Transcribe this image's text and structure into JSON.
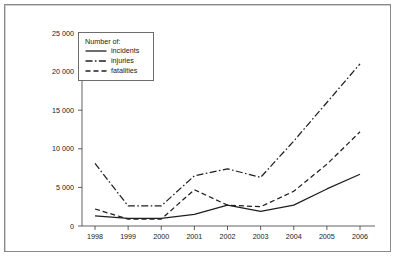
{
  "chart_data": {
    "type": "line",
    "title": "",
    "subtitle": "",
    "xlabel": "",
    "ylabel": "",
    "categories": [
      "1998",
      "1999",
      "2000",
      "2001",
      "2002",
      "2003",
      "2004",
      "2005",
      "2006"
    ],
    "x": [
      1998,
      1999,
      2000,
      2001,
      2002,
      2003,
      2004,
      2005,
      2006
    ],
    "series": [
      {
        "name": "incidents",
        "style": "solid",
        "values": [
          1300,
          1000,
          1000,
          1500,
          2700,
          1900,
          2700,
          4800,
          6700
        ]
      },
      {
        "name": "injuries",
        "style": "dash-dot",
        "values": [
          8100,
          2600,
          2600,
          6500,
          7400,
          6300,
          11000,
          16000,
          21000
        ]
      },
      {
        "name": "fatalities",
        "style": "dashed",
        "values": [
          2200,
          900,
          900,
          4700,
          2700,
          2500,
          4500,
          8000,
          12200
        ]
      }
    ],
    "ylim": [
      0,
      25000
    ],
    "yticks": [
      0,
      5000,
      10000,
      15000,
      20000,
      25000
    ],
    "ytick_labels": [
      "0",
      "5 000",
      "10 000",
      "15 000",
      "20 000",
      "25 000"
    ],
    "xtick_labels": [
      "1998",
      "1999",
      "2000",
      "2001",
      "2002",
      "2003",
      "2004",
      "2005",
      "2006"
    ],
    "grid": false,
    "legend_position": "top-left",
    "line_color": "#1f1f1f"
  },
  "legend": {
    "title": "Number of:",
    "entries": [
      {
        "label": "incidents",
        "style": "solid"
      },
      {
        "label": "injuries",
        "style": "dash-dot"
      },
      {
        "label": "fatalities",
        "style": "dashed"
      }
    ]
  }
}
